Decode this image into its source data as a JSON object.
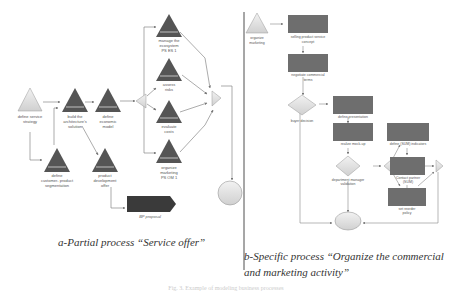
{
  "panel_a": {
    "caption": "a-Partial process “Service offer”",
    "nodes": {
      "define_service_strategy": [
        "define service",
        "strategy"
      ],
      "build_architecture": [
        "build the",
        "architecture's",
        "solution"
      ],
      "define_economic_model": [
        "define",
        "economic",
        "model"
      ],
      "manage_ecosystem": [
        "manage the",
        "ecosystem",
        "PS ES 1"
      ],
      "assess_risks": [
        "assess",
        "risks"
      ],
      "evaluate_costs": [
        "evaluate",
        "costs"
      ],
      "organize_marketing": [
        "organize",
        "marketing",
        "PS OM 1"
      ],
      "define_segmentation": [
        "define",
        "customer- product",
        "segmentation"
      ],
      "product_development": [
        "product",
        "development",
        "offer"
      ],
      "bp_proposal": [
        "BP proposal"
      ]
    }
  },
  "panel_b": {
    "caption_line1": "b-Specific process “Organize the commercial",
    "caption_line2": "and marketing activity”",
    "nodes": {
      "organize_marketing": [
        "organize",
        "marketing"
      ],
      "selling_product": [
        "selling product service",
        "concept"
      ],
      "negotiate_terms": [
        "negotiate commercial",
        "terms"
      ],
      "buyer_decision": [
        "buyer decision"
      ],
      "define_presentation": [
        "define presentation"
      ],
      "realize_mockup": [
        "realize mock-up"
      ],
      "define_sum_indicators": [
        "define (SUM) indicators"
      ],
      "dept_manager_validation": [
        "department manager",
        "validation"
      ],
      "contact_partner": [
        "Contact partner",
        "(SUM)"
      ],
      "set_reorder_policy": [
        "set reorder",
        "policy"
      ]
    }
  },
  "figure_caption": "Fig. 3. Example of modeling business processes",
  "colors": {
    "dark_fill": "#555555",
    "box_fill": "#6e6e6e",
    "light_fill": "#e4e4e4",
    "line": "#888888",
    "divider": "#222222"
  }
}
